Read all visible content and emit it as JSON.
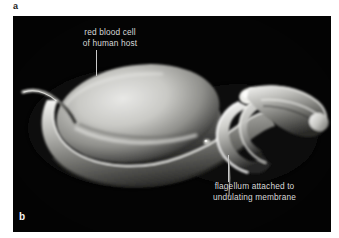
{
  "figure": {
    "panel_a_letter": "a",
    "panel_b_letter": "b",
    "background_color": "#ffffff",
    "photo_background_color": "#020202",
    "label_color": "#d8d8d8",
    "leader_color": "#c9c9c9"
  },
  "annotations": {
    "red_blood_cell": {
      "line1": "red blood cell",
      "line2": "of human host"
    },
    "flagellum": {
      "line1": "flagellum attached to",
      "line2": "undulating membrane"
    }
  },
  "specimen": {
    "micrograph_type": "scanning electron micrograph",
    "subject": "trypanosome with red blood cell"
  }
}
